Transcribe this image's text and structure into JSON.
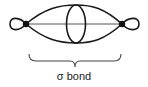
{
  "diagram": {
    "caption": "σ bond",
    "stroke_color": "#1a1a1a",
    "axis_color": "#555555",
    "brace_color": "#444444",
    "labels": {
      "bond_type": "σ bond"
    },
    "elements": [
      {
        "name": "left-nucleus",
        "type": "dot"
      },
      {
        "name": "right-nucleus",
        "type": "dot"
      },
      {
        "name": "left-back-lobe",
        "type": "loop"
      },
      {
        "name": "right-back-lobe",
        "type": "loop"
      },
      {
        "name": "overlap-region",
        "type": "ellipse"
      },
      {
        "name": "internuclear-axis",
        "type": "line"
      },
      {
        "name": "bracket",
        "type": "curly-brace"
      }
    ]
  }
}
